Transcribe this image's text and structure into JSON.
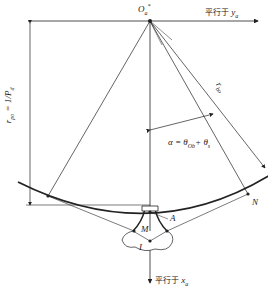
{
  "diagram": {
    "labels": {
      "origin": "O",
      "origin_sub": "a",
      "origin_sup": "*",
      "parallel_y": "平行于",
      "parallel_y_var": "y",
      "parallel_y_sub": "a",
      "parallel_x": "平行于",
      "parallel_x_var": "x",
      "parallel_x_sub": "a",
      "radius_left": "r",
      "radius_left_sub": "po",
      "radius_left_eq": "=",
      "radius_left_frac_num": "1",
      "radius_left_frac_den": "P",
      "radius_left_frac_den_sub": "d",
      "radius_right": "r",
      "radius_right_sub": "bo",
      "angle_eq": "α = θ",
      "angle_sub1": "Ob",
      "angle_plus": "+ θ",
      "angle_sub2": "s",
      "point_N": "N",
      "point_A": "A",
      "point_M": "M",
      "point_I": "I"
    },
    "colors": {
      "line": "#222222",
      "background": "#ffffff"
    }
  }
}
